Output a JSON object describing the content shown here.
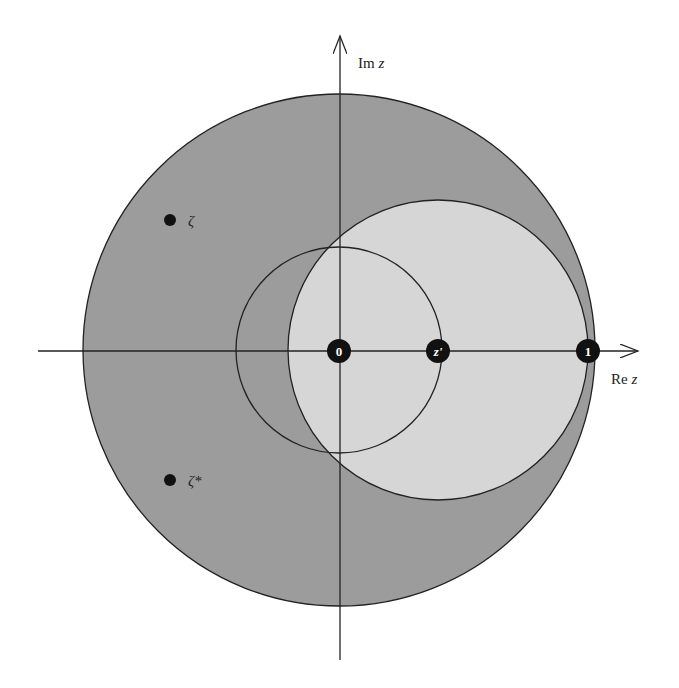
{
  "diagram": {
    "type": "complex-plane",
    "axes": {
      "x_label_prefix": "Re ",
      "x_label_var": "z",
      "y_label_prefix": "Im ",
      "y_label_var": "z"
    },
    "regions": [
      {
        "name": "unit-disk",
        "fill": "#9c9c9c",
        "center": [
          0,
          0
        ],
        "radius": 1
      },
      {
        "name": "disk-about-z-prime",
        "fill": "#d6d6d6",
        "center": [
          "z'",
          0
        ],
        "radius": "1 - z'"
      },
      {
        "name": "circle-about-origin",
        "fill": "none",
        "center": [
          0,
          0
        ],
        "radius": "z'"
      }
    ],
    "marked_points": [
      {
        "id": "origin",
        "label": "0"
      },
      {
        "id": "z-prime",
        "label": "z'"
      },
      {
        "id": "one",
        "label": "1"
      }
    ],
    "other_points": [
      {
        "id": "zeta",
        "label": "ζ"
      },
      {
        "id": "zeta-conj",
        "label": "ζ*"
      }
    ]
  }
}
